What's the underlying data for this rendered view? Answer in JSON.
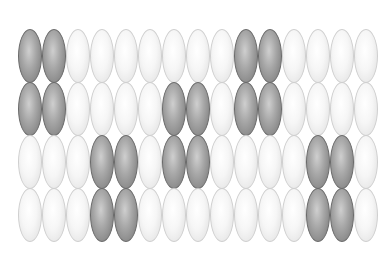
{
  "pattern": {
    "columns": 15,
    "rows": 4,
    "colors": {
      "light": "#f2f2f2",
      "dark": "#8a8a8a"
    },
    "dark_cells": [
      [
        0,
        1,
        9,
        10
      ],
      [
        0,
        1,
        6,
        7,
        9,
        10
      ],
      [
        3,
        4,
        6,
        7,
        12,
        13
      ],
      [
        3,
        4,
        12,
        13
      ]
    ]
  }
}
